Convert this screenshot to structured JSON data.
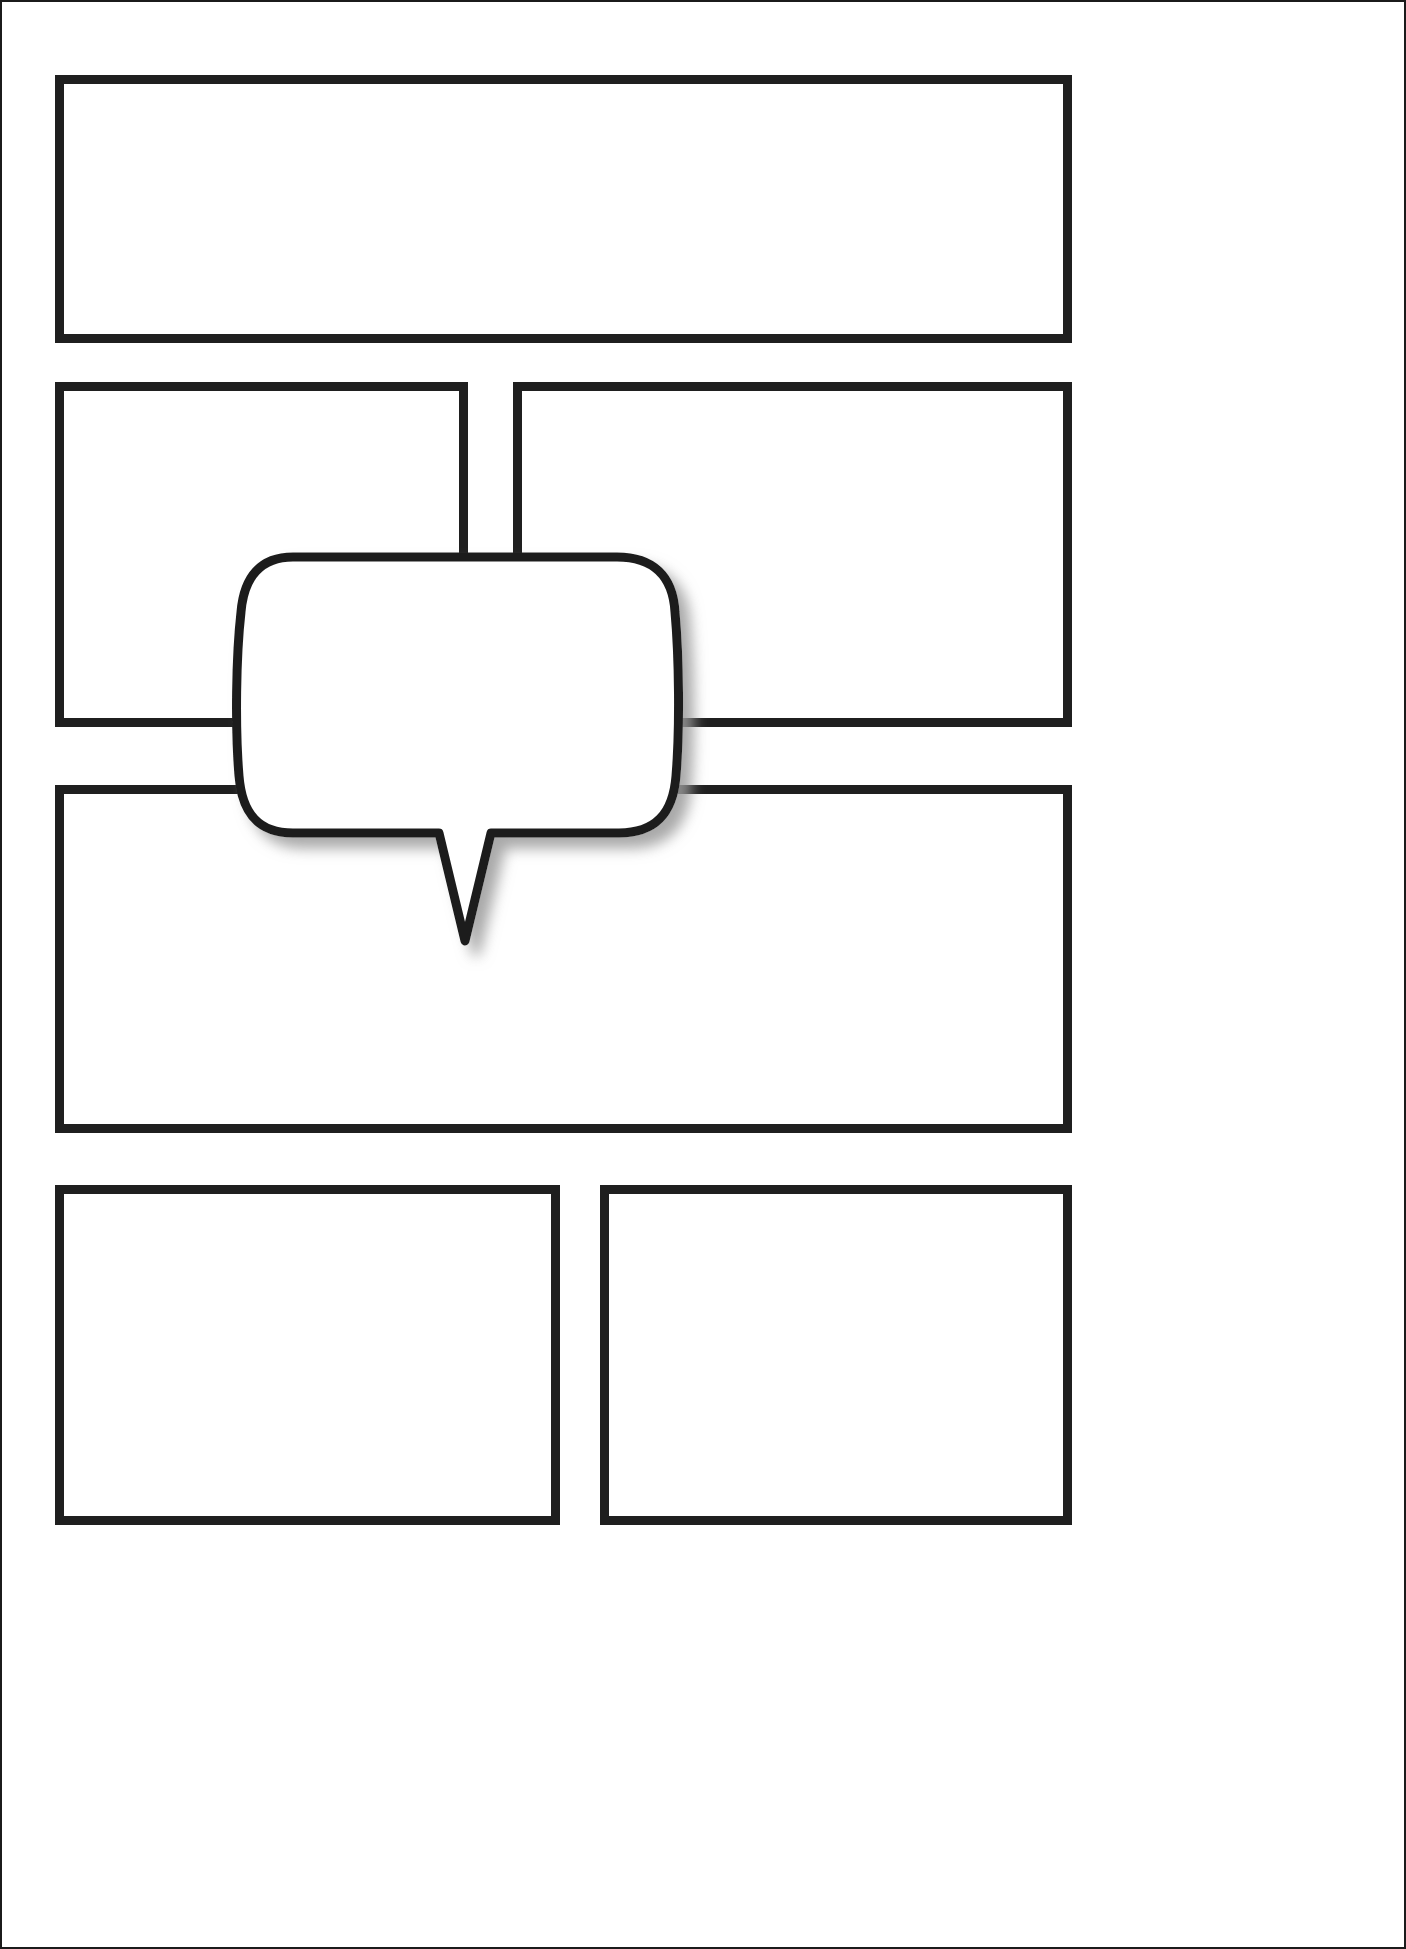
{
  "document": {
    "title": "Blank Comic Page Template",
    "page_width": 1406,
    "page_height": 1949,
    "background_color": "#ffffff",
    "ink_color": "#1f1f1f",
    "border_color": "#1b1b1b",
    "panel_border_width": 9,
    "page_edge_border_width": 2
  },
  "panels": [
    {
      "id": "panel-1",
      "label": "",
      "row": 1,
      "column": 1,
      "x": 55,
      "y": 75,
      "width": 1017,
      "height": 268,
      "content": ""
    },
    {
      "id": "panel-2",
      "label": "",
      "row": 2,
      "column": 1,
      "x": 55,
      "y": 382,
      "width": 413,
      "height": 345,
      "content": ""
    },
    {
      "id": "panel-3",
      "label": "",
      "row": 2,
      "column": 2,
      "x": 513,
      "y": 382,
      "width": 559,
      "height": 345,
      "content": ""
    },
    {
      "id": "panel-4",
      "label": "",
      "row": 3,
      "column": 1,
      "x": 55,
      "y": 785,
      "width": 1017,
      "height": 348,
      "content": ""
    },
    {
      "id": "panel-5",
      "label": "",
      "row": 4,
      "column": 1,
      "x": 55,
      "y": 1185,
      "width": 505,
      "height": 340,
      "content": ""
    },
    {
      "id": "panel-6",
      "label": "",
      "row": 4,
      "column": 2,
      "x": 600,
      "y": 1185,
      "width": 472,
      "height": 340,
      "content": ""
    }
  ],
  "speech_balloon": {
    "id": "speech-balloon",
    "text": "",
    "fill_color": "#ffffff",
    "stroke_color": "#1f1f1f",
    "stroke_width": 9,
    "shadow_color": "#b5b5b5",
    "x": 245,
    "y": 557,
    "width": 430,
    "height": 303,
    "tail_tip_x": 465,
    "tail_tip_y": 941,
    "tail_direction": "down"
  }
}
